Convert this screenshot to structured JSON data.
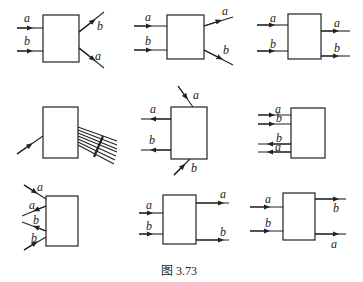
{
  "figure": {
    "caption": "图 3.73",
    "panels": [
      {
        "id": 1,
        "in": [
          "a",
          "b"
        ],
        "out": [
          "b",
          "a"
        ],
        "description": "a and b enter from left; b exits up-right, a exits down-right"
      },
      {
        "id": 2,
        "in": [
          "a",
          "b"
        ],
        "out": [
          "a",
          "b"
        ],
        "description": "a and b enter from left; a exits up-right, b exits down-right"
      },
      {
        "id": 3,
        "in": [
          "a",
          "b"
        ],
        "out": [
          "a",
          "b"
        ],
        "description": "a and b enter from left; a and b exit right horizontally"
      },
      {
        "id": 4,
        "in": [],
        "out": [],
        "description": "single incoming line at lower left; fan of many outgoing lines to right"
      },
      {
        "id": 5,
        "in": [
          "a",
          "b"
        ],
        "out": [
          "a",
          "b"
        ],
        "description": "a enters from top, b enters from bottom; a and b exit left"
      },
      {
        "id": 6,
        "in": [
          "a",
          "b"
        ],
        "out": [
          "b",
          "a"
        ],
        "description": "a and b enter from left; b and a exit back to left"
      },
      {
        "id": 7,
        "in": [
          "a",
          "b"
        ],
        "out": [
          "a",
          "b"
        ],
        "description": "a enters from upper-left, a exits lower-left; b exits, b enters from lower-left"
      },
      {
        "id": 8,
        "in": [
          "a",
          "b"
        ],
        "out": [
          "a",
          "b"
        ],
        "description": "a and b enter left; a and b exit right, spread apart"
      },
      {
        "id": 9,
        "in": [
          "a",
          "b"
        ],
        "out": [
          "b",
          "a"
        ],
        "description": "a and b enter left; b exits upper-right, a exits lower-right"
      }
    ],
    "labels": {
      "a": "a",
      "b": "b"
    }
  }
}
